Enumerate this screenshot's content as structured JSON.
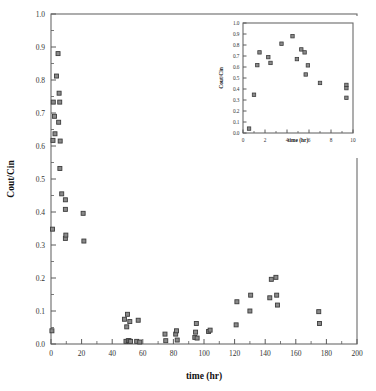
{
  "chart_data": {
    "type": "scatter",
    "title": "",
    "xlabel": "time (hr)",
    "ylabel": "Cout/Cin",
    "xlim": [
      0,
      200
    ],
    "ylim": [
      0.0,
      1.0
    ],
    "xticks": [
      0,
      20,
      40,
      60,
      80,
      100,
      120,
      140,
      160,
      180,
      200
    ],
    "xticklabels": [
      "0",
      "20",
      "40",
      "60",
      "80",
      "100",
      "120",
      "140",
      "160",
      "180",
      "200"
    ],
    "yticks": [
      0.0,
      0.1,
      0.2,
      0.3,
      0.4,
      0.5,
      0.6,
      0.7,
      0.8,
      0.9,
      1.0
    ],
    "yticklabels": [
      "0.0",
      "0.1",
      "0.2",
      "0.3",
      "0.4",
      "0.5",
      "0.6",
      "0.7",
      "0.8",
      "0.9",
      "1.0"
    ],
    "minor_ticks_per_interval": 2,
    "grid": false,
    "legend": false,
    "marker": "filled-square",
    "marker_color": "#8a8a8a",
    "marker_edge_color": "#3c3c3c",
    "series": [
      {
        "name": "Cout/Cin",
        "points": [
          [
            0.6,
            0.04
          ],
          [
            1.0,
            0.348
          ],
          [
            1.3,
            0.617
          ],
          [
            1.5,
            0.733
          ],
          [
            2.3,
            0.69
          ],
          [
            2.6,
            0.637
          ],
          [
            3.6,
            0.812
          ],
          [
            4.6,
            0.88
          ],
          [
            5.0,
            0.672
          ],
          [
            5.3,
            0.76
          ],
          [
            5.7,
            0.733
          ],
          [
            6.0,
            0.615
          ],
          [
            5.8,
            0.532
          ],
          [
            7.0,
            0.455
          ],
          [
            9.4,
            0.437
          ],
          [
            9.4,
            0.408
          ],
          [
            9.4,
            0.32
          ],
          [
            9.7,
            0.33
          ],
          [
            21.0,
            0.396
          ],
          [
            21.5,
            0.312
          ],
          [
            48.0,
            0.075
          ],
          [
            49.0,
            0.008
          ],
          [
            49.5,
            0.052
          ],
          [
            50.0,
            0.09
          ],
          [
            50.5,
            0.01
          ],
          [
            51.0,
            0.01
          ],
          [
            51.5,
            0.068
          ],
          [
            52.0,
            0.008
          ],
          [
            56.0,
            0.008
          ],
          [
            57.0,
            0.072
          ],
          [
            58.0,
            0.006
          ],
          [
            74.5,
            0.03
          ],
          [
            75.0,
            0.01
          ],
          [
            81.5,
            0.03
          ],
          [
            82.0,
            0.04
          ],
          [
            82.5,
            0.012
          ],
          [
            94.0,
            0.02
          ],
          [
            94.5,
            0.036
          ],
          [
            95.0,
            0.062
          ],
          [
            95.5,
            0.018
          ],
          [
            103.0,
            0.038
          ],
          [
            104.0,
            0.042
          ],
          [
            121.0,
            0.058
          ],
          [
            121.5,
            0.128
          ],
          [
            130.0,
            0.1
          ],
          [
            130.5,
            0.148
          ],
          [
            143.0,
            0.14
          ],
          [
            144.0,
            0.196
          ],
          [
            147.0,
            0.202
          ],
          [
            147.5,
            0.148
          ],
          [
            148.0,
            0.118
          ],
          [
            175.0,
            0.098
          ],
          [
            175.5,
            0.062
          ]
        ]
      }
    ],
    "inset": {
      "type": "scatter",
      "xlabel": "time (hr)",
      "ylabel": "Cout/Cin",
      "xlim": [
        0,
        10
      ],
      "ylim": [
        0.0,
        1.0
      ],
      "xticks": [
        0,
        2,
        4,
        6,
        8,
        10
      ],
      "xticklabels": [
        "0",
        "2",
        "4",
        "6",
        "8",
        "10"
      ],
      "yticks": [
        0.0,
        0.1,
        0.2,
        0.3,
        0.4,
        0.5,
        0.6,
        0.7,
        0.8,
        0.9,
        1.0
      ],
      "yticklabels": [
        "0.0",
        "0.1",
        "0.2",
        "0.3",
        "0.4",
        "0.5",
        "0.6",
        "0.7",
        "0.8",
        "0.9",
        "1.0"
      ],
      "grid": false,
      "legend": false,
      "series": [
        {
          "name": "Cout/Cin",
          "points": [
            [
              0.55,
              0.04
            ],
            [
              1.0,
              0.348
            ],
            [
              1.3,
              0.617
            ],
            [
              1.5,
              0.733
            ],
            [
              2.3,
              0.69
            ],
            [
              2.5,
              0.637
            ],
            [
              3.5,
              0.812
            ],
            [
              4.5,
              0.88
            ],
            [
              4.9,
              0.672
            ],
            [
              5.3,
              0.76
            ],
            [
              5.6,
              0.733
            ],
            [
              5.9,
              0.615
            ],
            [
              5.7,
              0.532
            ],
            [
              7.0,
              0.455
            ],
            [
              9.4,
              0.437
            ],
            [
              9.4,
              0.408
            ],
            [
              9.4,
              0.32
            ]
          ]
        }
      ]
    }
  }
}
